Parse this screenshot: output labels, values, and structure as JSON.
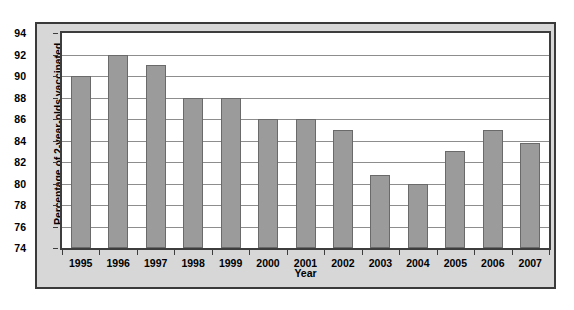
{
  "chart_data": {
    "type": "bar",
    "title": "",
    "xlabel": "Year",
    "ylabel": "Percentage of 2-year-olds vaccinated",
    "categories": [
      "1995",
      "1996",
      "1997",
      "1998",
      "1999",
      "2000",
      "2001",
      "2002",
      "2003",
      "2004",
      "2005",
      "2006",
      "2007"
    ],
    "values": [
      90,
      92,
      91,
      88,
      88,
      86,
      86,
      85,
      80.8,
      80,
      83,
      85,
      83.8
    ],
    "ylim": [
      74,
      94
    ],
    "yticks": [
      74,
      76,
      78,
      80,
      82,
      84,
      86,
      88,
      90,
      92,
      94
    ],
    "ytick_labels": [
      "74",
      "76",
      "78",
      "80",
      "82",
      "84",
      "86",
      "88",
      "90",
      "92",
      "94"
    ],
    "grid": true,
    "legend": false,
    "bar_color": "#9b9b9b",
    "bar_border_color": "#6a6a6a",
    "plot_background": "#ffffff",
    "figure_background": "#d7d7d7",
    "axis_color": "#3d3d3d",
    "gridline_color": "#8d8d8d"
  }
}
